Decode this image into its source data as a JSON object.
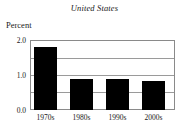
{
  "chart_data": {
    "type": "bar",
    "title": "United States",
    "subtitle": "",
    "xlabel": "",
    "ylabel": "Percent",
    "categories": [
      "1970s",
      "1980s",
      "1990s",
      "2000s"
    ],
    "values": [
      1.8,
      0.88,
      0.88,
      0.82
    ],
    "series": [
      {
        "name": "United States",
        "values": [
          1.8,
          0.88,
          0.88,
          0.82
        ]
      }
    ],
    "ylim": [
      0.0,
      2.0
    ],
    "ytick_labels": [
      "0.0",
      "1.0",
      "2.0"
    ],
    "ytick_values": [
      0.0,
      1.0,
      2.0
    ],
    "gridline_values": [
      0.5,
      1.0,
      1.5,
      2.0
    ],
    "grid": true,
    "legend": false,
    "legend_position": "none",
    "bar_color": "#000000",
    "axis_color": "#8a8a8a",
    "grid_color": "#9a9a9a",
    "background_color": "#ffffff",
    "annotations": []
  },
  "labels": {
    "y_0": "0.0",
    "y_1": "1.0",
    "y_2": "2.0",
    "x_0": "1970s",
    "x_1": "1980s",
    "x_2": "1990s",
    "x_3": "2000s"
  }
}
